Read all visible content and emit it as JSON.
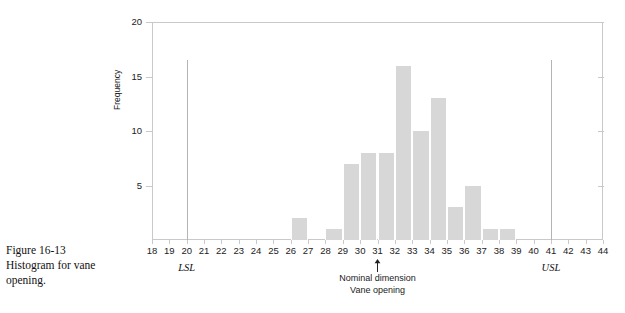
{
  "caption": {
    "line1": "Figure 16-13",
    "line2": "Histogram for vane",
    "line3": "opening."
  },
  "axes": {
    "y_title": "Frequency",
    "y_ticks": [
      0,
      5,
      10,
      15,
      20
    ],
    "y_tick_labels": [
      "",
      "5",
      "10",
      "15",
      "20"
    ],
    "x_ticks": [
      18,
      19,
      20,
      21,
      22,
      23,
      24,
      25,
      26,
      27,
      28,
      29,
      30,
      31,
      32,
      33,
      34,
      35,
      36,
      37,
      38,
      39,
      40,
      41,
      42,
      43,
      44
    ],
    "x_tick_labels": [
      "18",
      "19",
      "20",
      "21",
      "22",
      "23",
      "24",
      "25",
      "26",
      "27",
      "28",
      "29",
      "30",
      "31",
      "32",
      "33",
      "34",
      "35",
      "36",
      "37",
      "38",
      "39",
      "40",
      "41",
      "42",
      "43",
      "44"
    ]
  },
  "annotations": {
    "lsl_label": "LSL",
    "lsl_value": 20,
    "usl_label": "USL",
    "usl_value": 41,
    "nominal_value": 31,
    "nominal_line1": "Nominal dimension",
    "nominal_line2": "Vane opening",
    "arrow_icon": "up-arrow-icon"
  },
  "colors": {
    "bar_fill": "#d7d7d7",
    "frame": "#c9c9c9",
    "spec_line": "#b4b4b4",
    "text": "#222222"
  },
  "chart_data": {
    "type": "bar",
    "title": "Histogram for vane opening",
    "xlabel": "Vane opening",
    "ylabel": "Frequency",
    "xlim": [
      18,
      44
    ],
    "ylim": [
      0,
      20
    ],
    "grid": false,
    "legend": "none",
    "bin_width": 1,
    "categories": [
      "27",
      "28",
      "29",
      "30",
      "31",
      "32",
      "33",
      "34",
      "35",
      "36",
      "37",
      "38",
      "39"
    ],
    "values": [
      2,
      0,
      1,
      7,
      8,
      8,
      16,
      10,
      13,
      3,
      5,
      1,
      1
    ],
    "bins": [
      {
        "left": 26,
        "right": 27,
        "value": 2
      },
      {
        "left": 28,
        "right": 29,
        "value": 1
      },
      {
        "left": 29,
        "right": 30,
        "value": 7
      },
      {
        "left": 30,
        "right": 31,
        "value": 8
      },
      {
        "left": 31,
        "right": 32,
        "value": 8
      },
      {
        "left": 32,
        "right": 33,
        "value": 16
      },
      {
        "left": 33,
        "right": 34,
        "value": 10
      },
      {
        "left": 34,
        "right": 35,
        "value": 13
      },
      {
        "left": 35,
        "right": 36,
        "value": 3
      },
      {
        "left": 36,
        "right": 37,
        "value": 5
      },
      {
        "left": 37,
        "right": 38,
        "value": 1
      },
      {
        "left": 38,
        "right": 39,
        "value": 1
      }
    ],
    "vlines": [
      {
        "x": 20,
        "label": "LSL",
        "top_value": 16.5
      },
      {
        "x": 41,
        "label": "USL",
        "top_value": 16.5
      }
    ],
    "markers": [
      {
        "x": 31,
        "label": "Nominal dimension"
      }
    ]
  }
}
